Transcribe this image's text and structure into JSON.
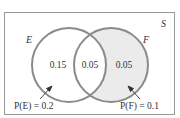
{
  "diagram": {
    "type": "venn",
    "universe_label": "S",
    "sets": [
      {
        "label": "E",
        "only_value": "0.15",
        "annotation": "P(E) = 0.2"
      },
      {
        "label": "F",
        "only_value": "0.05",
        "annotation": "P(F) = 0.1"
      }
    ],
    "intersection_value": "0.05",
    "colors": {
      "circle_stroke": "#8a8a8a",
      "box_stroke": "#9a9a9a",
      "f_only_fill": "#ebebeb",
      "text": "#333333"
    }
  }
}
